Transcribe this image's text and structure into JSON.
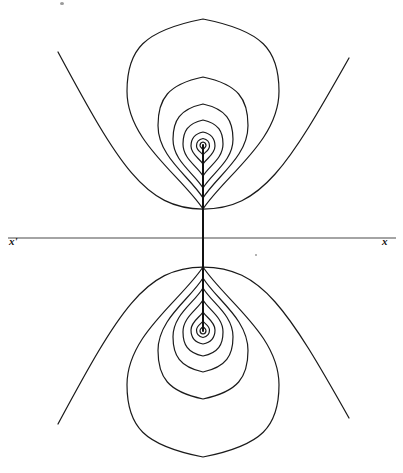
{
  "figure": {
    "width": 403,
    "height": 473,
    "background_color": "#ffffff",
    "ink_color": "#1a1a1a",
    "axis_color": "#4a4a4a"
  },
  "labels": {
    "left_axis_label": "x'",
    "right_axis_label": "x"
  },
  "chart_data": {
    "type": "line",
    "xlabel": "x",
    "ylabel": "",
    "grid": false,
    "legend": "none",
    "xlim": [
      0,
      403
    ],
    "ylim": [
      0,
      473
    ],
    "axis_line": {
      "name": "horizontal-axis",
      "y": 238,
      "x_start": 8,
      "x_end": 396,
      "stroke_width": 1.1,
      "color": "#4a4a4a"
    },
    "dipole_axis_segment": {
      "name": "vertical-dipole-axis",
      "x": 203,
      "y_start": 145,
      "y_end": 331,
      "stroke_width": 2.0,
      "color": "#111111"
    },
    "poles": [
      {
        "name": "upper-pole",
        "x": 203,
        "y": 145
      },
      {
        "name": "lower-pole",
        "x": 203,
        "y": 331
      }
    ],
    "series": [
      {
        "name": "upper-closed-contour-1",
        "group": "upper",
        "kind": "closed-teardrop",
        "center_x": 203,
        "pole_y": 145,
        "top_y": 142.0,
        "cusp_y": 149.5,
        "half_width": 3.0,
        "widest_y_frac": 0.45
      },
      {
        "name": "upper-closed-contour-2",
        "group": "upper",
        "kind": "closed-teardrop",
        "center_x": 203,
        "pole_y": 145,
        "top_y": 138.5,
        "cusp_y": 155.0,
        "half_width": 6.5,
        "widest_y_frac": 0.45
      },
      {
        "name": "upper-closed-contour-3",
        "group": "upper",
        "kind": "closed-teardrop",
        "center_x": 203,
        "pole_y": 145,
        "top_y": 132.0,
        "cusp_y": 164.0,
        "half_width": 12.0,
        "widest_y_frac": 0.44
      },
      {
        "name": "upper-closed-contour-4",
        "group": "upper",
        "kind": "closed-teardrop",
        "center_x": 203,
        "pole_y": 145,
        "top_y": 120.0,
        "cusp_y": 176.0,
        "half_width": 20.0,
        "widest_y_frac": 0.43
      },
      {
        "name": "upper-closed-contour-5",
        "group": "upper",
        "kind": "closed-teardrop",
        "center_x": 203,
        "pole_y": 145,
        "top_y": 104.0,
        "cusp_y": 188.0,
        "half_width": 30.0,
        "widest_y_frac": 0.42
      },
      {
        "name": "upper-closed-contour-6",
        "group": "upper",
        "kind": "closed-teardrop",
        "center_x": 203,
        "pole_y": 145,
        "top_y": 77.0,
        "cusp_y": 198.0,
        "half_width": 45.0,
        "widest_y_frac": 0.4
      },
      {
        "name": "upper-closed-contour-7",
        "group": "upper",
        "kind": "closed-teardrop",
        "center_x": 203,
        "pole_y": 145,
        "top_y": 19.0,
        "cusp_y": 209.0,
        "half_width": 76.0,
        "widest_y_frac": 0.38
      },
      {
        "name": "upper-open-branch",
        "group": "upper",
        "kind": "open-u-curve",
        "left_x": 58,
        "left_y": 52,
        "right_x": 349,
        "right_y": 58,
        "vertex_x": 203,
        "vertex_y": 209
      },
      {
        "name": "lower-closed-contour-1",
        "group": "lower",
        "kind": "closed-teardrop",
        "center_x": 203,
        "pole_y": 331,
        "top_y": 334.0,
        "cusp_y": 326.5,
        "half_width": 3.0,
        "widest_y_frac": 0.45
      },
      {
        "name": "lower-closed-contour-2",
        "group": "lower",
        "kind": "closed-teardrop",
        "center_x": 203,
        "pole_y": 331,
        "top_y": 337.5,
        "cusp_y": 321.0,
        "half_width": 6.5,
        "widest_y_frac": 0.45
      },
      {
        "name": "lower-closed-contour-3",
        "group": "lower",
        "kind": "closed-teardrop",
        "center_x": 203,
        "pole_y": 331,
        "top_y": 344.0,
        "cusp_y": 312.0,
        "half_width": 12.0,
        "widest_y_frac": 0.44
      },
      {
        "name": "lower-closed-contour-4",
        "group": "lower",
        "kind": "closed-teardrop",
        "center_x": 203,
        "pole_y": 331,
        "top_y": 356.0,
        "cusp_y": 300.0,
        "half_width": 20.0,
        "widest_y_frac": 0.43
      },
      {
        "name": "lower-closed-contour-5",
        "group": "lower",
        "kind": "closed-teardrop",
        "center_x": 203,
        "pole_y": 331,
        "top_y": 372.0,
        "cusp_y": 288.0,
        "half_width": 30.0,
        "widest_y_frac": 0.42
      },
      {
        "name": "lower-closed-contour-6",
        "group": "lower",
        "kind": "closed-teardrop",
        "center_x": 203,
        "pole_y": 331,
        "top_y": 399.0,
        "cusp_y": 278.0,
        "half_width": 45.0,
        "widest_y_frac": 0.4
      },
      {
        "name": "lower-closed-contour-7",
        "group": "lower",
        "kind": "closed-teardrop",
        "center_x": 203,
        "pole_y": 331,
        "top_y": 457.0,
        "cusp_y": 267.0,
        "half_width": 76.0,
        "widest_y_frac": 0.38
      },
      {
        "name": "lower-open-branch",
        "group": "lower",
        "kind": "open-u-curve",
        "left_x": 58,
        "left_y": 424,
        "right_x": 349,
        "right_y": 418,
        "vertex_x": 203,
        "vertex_y": 267
      }
    ],
    "annotations": [
      {
        "name": "left-axis-label",
        "text": "x'",
        "x": 14,
        "y": 241
      },
      {
        "name": "right-axis-label",
        "text": "x",
        "x": 387,
        "y": 241
      }
    ]
  },
  "specks": [
    {
      "name": "speck-top",
      "x": 60,
      "y": 2,
      "w": 4,
      "h": 3
    },
    {
      "name": "speck-mid",
      "x": 255,
      "y": 254,
      "w": 2,
      "h": 2
    }
  ]
}
